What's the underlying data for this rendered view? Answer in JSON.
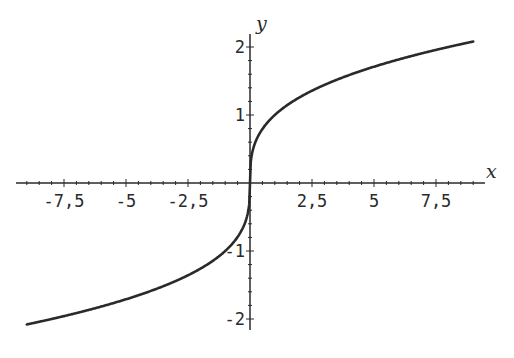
{
  "chart_data": {
    "type": "line",
    "title": "",
    "function": "y = cbrt(x)",
    "xlabel": "x",
    "ylabel": "y",
    "xlim": [
      -9.5,
      9.5
    ],
    "ylim": [
      -2.1,
      2.1
    ],
    "x_ticks": [
      {
        "value": -7.5,
        "label": "-7,5"
      },
      {
        "value": -5,
        "label": "-5"
      },
      {
        "value": -2.5,
        "label": "-2,5"
      },
      {
        "value": 2.5,
        "label": "2,5"
      },
      {
        "value": 5,
        "label": "5"
      },
      {
        "value": 7.5,
        "label": "7,5"
      }
    ],
    "y_ticks": [
      {
        "value": 2,
        "label": "2"
      },
      {
        "value": 1,
        "label": "1"
      },
      {
        "value": -1,
        "label": "-1"
      },
      {
        "value": -2,
        "label": "-2"
      }
    ],
    "series": [
      {
        "name": "cbrt(x)",
        "x": [
          -9,
          -8,
          -6,
          -4,
          -2,
          -1,
          -0.5,
          -0.1,
          -0.01,
          0,
          0.01,
          0.1,
          0.5,
          1,
          2,
          4,
          6,
          8,
          9
        ],
        "y": [
          -2.08,
          -2.0,
          -1.82,
          -1.59,
          -1.26,
          -1.0,
          -0.79,
          -0.46,
          -0.22,
          0,
          0.22,
          0.46,
          0.79,
          1.0,
          1.26,
          1.59,
          1.82,
          2.0,
          2.08
        ]
      }
    ],
    "grid": false,
    "legend": "none"
  }
}
